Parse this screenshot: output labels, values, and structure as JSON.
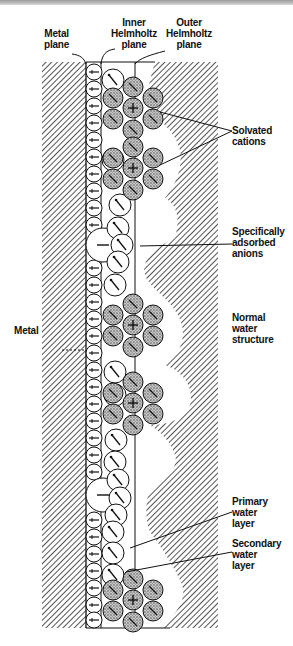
{
  "figure": {
    "labels": {
      "metal_plane": [
        "Metal",
        "plane"
      ],
      "inner_helmholtz": [
        "Inner",
        "Helmholtz",
        "plane"
      ],
      "outer_helmholtz": [
        "Outer",
        "Helmholtz",
        "plane"
      ],
      "solvated_cations": [
        "Solvated",
        "cations"
      ],
      "specifically_adsorbed_anions": [
        "Specifically",
        "adsorbed",
        "anions"
      ],
      "normal_water_structure": [
        "Normal",
        "water",
        "structure"
      ],
      "metal": "Metal",
      "primary_water_layer": [
        "Primary",
        "water",
        "layer"
      ],
      "secondary_water_layer": [
        "Secondary",
        "water",
        "layer"
      ]
    },
    "colors": {
      "ink": "#111111",
      "hatch": "#2a2a2a",
      "background": "#ffffff",
      "stipple": "#8a8a8a"
    }
  }
}
